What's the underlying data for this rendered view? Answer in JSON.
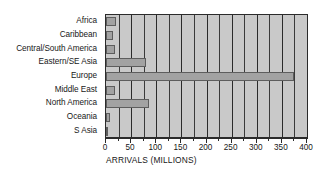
{
  "chart_data": {
    "type": "bar",
    "orientation": "horizontal",
    "title": "",
    "xlabel": "ARRIVALS (MILLIONS)",
    "ylabel": "",
    "categories": [
      "Africa",
      "Caribbean",
      "Central/South America",
      "Eastern/SE Asia",
      "Europe",
      "Middle East",
      "North America",
      "Oceania",
      "S Asia"
    ],
    "values": [
      20,
      13,
      17,
      80,
      375,
      17,
      85,
      8,
      4
    ],
    "xlim": [
      0,
      400
    ],
    "xticks": [
      0,
      50,
      100,
      150,
      200,
      250,
      300,
      350,
      400
    ],
    "xtick_labels": [
      "0",
      "50",
      "100",
      "150",
      "200",
      "250",
      "300",
      "350",
      "400"
    ],
    "minor_tick_step": 25,
    "grid": "vertical",
    "legend": "none",
    "colors": {
      "bar_fill": "#a2a2a2",
      "bar_edge": "#5d5d5d",
      "plot_background": "#c9c9c9",
      "gridline": "#3a3a3a",
      "axis": "#2b2b2b",
      "text": "#171717",
      "figure_background": "#ffffff"
    }
  }
}
